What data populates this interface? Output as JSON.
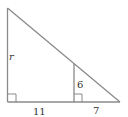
{
  "diagram": {
    "type": "similar-right-triangles",
    "stroke_color": "#8a8a8a",
    "labels": {
      "left_side": "r",
      "inner_height": "6",
      "base_left": "11",
      "base_right": "7"
    },
    "right_angle_markers": 2
  }
}
